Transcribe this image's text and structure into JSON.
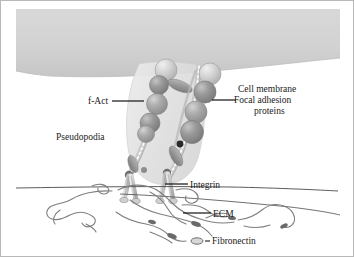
{
  "figure": {
    "background": "#ffffff",
    "width": 354,
    "height": 257
  },
  "labels": {
    "cell_membrane": "Cell membrane",
    "focal_adhesion_line1": "Focal adhesion",
    "focal_adhesion_line2": "proteins",
    "f_act": "f-Act",
    "pseudopodia": "Pseudopodia",
    "integrin": "Integrin",
    "ecm": "ECM",
    "fibronectin": "Fibronectin"
  },
  "colors": {
    "cell_body": "#d2d2d2",
    "cell_body_edge": "#c2c2c2",
    "pseudopodia": "#e2e2e2",
    "protein_sphere_dark": "#8e8e8e",
    "protein_sphere_mid": "#a6a6a6",
    "protein_sphere_light": "#cfcfcf",
    "actin_filament": "#bdbdbd",
    "integrin_stalk": "#cbcbcb",
    "ecm_fiber": "#8a8a8a",
    "substrate_line": "#555555",
    "leader_line": "#111111",
    "text": "#1a1a1a",
    "frame": "#b8b8b8"
  },
  "elements": {
    "cell_body_note": "large gray cytoplasm band across top with curved lower boundary",
    "pseudopodia_note": "translucent light gray lobe projecting downward from cell body",
    "actin_note": "two beaded filament chains running from membrane down to integrins",
    "sphere_count_left": 5,
    "sphere_count_right": 5,
    "integrin_count": 4,
    "ecm_note": "tangled fibronectin fibers beneath substrate line"
  }
}
